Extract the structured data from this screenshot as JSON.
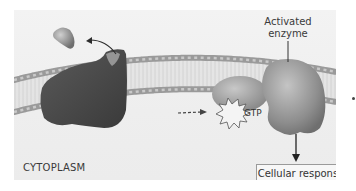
{
  "diagram": {
    "labels": {
      "activated_enzyme_line1": "Activated",
      "activated_enzyme_line2": "enzyme",
      "gtp": "GTP",
      "cytoplasm": "CYTOPLASM",
      "cellular_response": "Cellular response"
    },
    "elements": {
      "membrane": "lipid-bilayer",
      "receptor": "dark-membrane-receptor",
      "ligand": "signal-molecule",
      "g_protein": "g-protein-with-gtp",
      "enzyme": "activated-enzyme"
    },
    "colors": {
      "background": "#efefef",
      "membrane_head": "#9a9a9a",
      "membrane_tail": "#cfcfcf",
      "receptor": "#4a4a4a",
      "enzyme": "#8e8e8e",
      "g_protein": "#9c9c9c",
      "text": "#3a3a3a"
    }
  }
}
